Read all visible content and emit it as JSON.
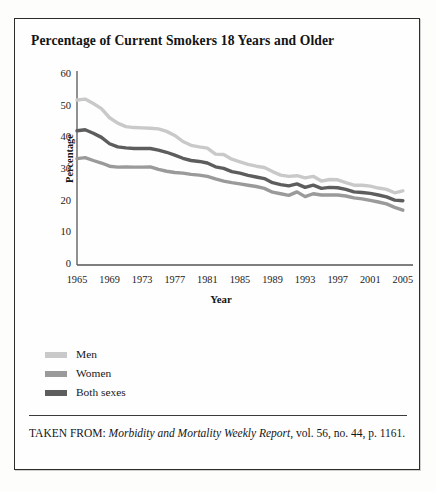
{
  "figure": {
    "title": "Percentage of Current Smokers 18 Years and Older",
    "source_prefix": "TAKEN FROM:",
    "source_italic": "Morbidity and Mortality Weekly Report",
    "source_rest": ", vol. 56, no. 44, p. 1161."
  },
  "legend": {
    "position": "below-plot",
    "items": [
      {
        "label": "Men",
        "color": "#c9c9c9"
      },
      {
        "label": "Women",
        "color": "#9a9a9a"
      },
      {
        "label": "Both sexes",
        "color": "#5d5d5d"
      }
    ]
  },
  "chart_data": {
    "type": "line",
    "title": "Percentage of Current Smokers 18 Years and Older",
    "xlabel": "Year",
    "ylabel": "Percentage",
    "xlim": [
      1965,
      2006
    ],
    "ylim": [
      0,
      60
    ],
    "yticks": [
      0,
      10,
      20,
      30,
      40,
      50,
      60
    ],
    "xticks": [
      1965,
      1969,
      1973,
      1977,
      1981,
      1985,
      1989,
      1993,
      1997,
      2001,
      2005
    ],
    "grid": false,
    "x": [
      1965,
      1966,
      1967,
      1968,
      1969,
      1970,
      1971,
      1972,
      1973,
      1974,
      1975,
      1976,
      1977,
      1978,
      1979,
      1980,
      1981,
      1982,
      1983,
      1984,
      1985,
      1986,
      1987,
      1988,
      1989,
      1990,
      1991,
      1992,
      1993,
      1994,
      1995,
      1996,
      1997,
      1998,
      1999,
      2000,
      2001,
      2002,
      2003,
      2004,
      2005
    ],
    "series": [
      {
        "name": "Men",
        "color": "#c9c9c9",
        "values": [
          52.1,
          52.4,
          51.0,
          49.4,
          46.5,
          44.8,
          43.7,
          43.4,
          43.3,
          43.2,
          43.0,
          42.2,
          40.9,
          39.0,
          37.8,
          37.3,
          36.9,
          35.0,
          34.9,
          33.4,
          32.6,
          31.8,
          31.2,
          30.8,
          29.5,
          28.4,
          28.0,
          28.2,
          27.5,
          28.0,
          26.5,
          27.0,
          26.9,
          26.0,
          25.2,
          25.2,
          24.9,
          24.3,
          23.9,
          22.8,
          23.4
        ]
      },
      {
        "name": "Women",
        "color": "#9a9a9a",
        "values": [
          33.6,
          33.9,
          33.0,
          32.2,
          31.2,
          30.9,
          31.0,
          30.9,
          30.9,
          31.0,
          30.2,
          29.6,
          29.2,
          29.0,
          28.6,
          28.4,
          28.0,
          27.2,
          26.5,
          26.0,
          25.6,
          25.2,
          24.8,
          24.2,
          23.0,
          22.5,
          22.0,
          23.1,
          21.6,
          22.5,
          22.1,
          22.1,
          22.1,
          21.8,
          21.2,
          20.9,
          20.4,
          19.9,
          19.3,
          18.2,
          17.3
        ]
      },
      {
        "name": "Both sexes",
        "color": "#5d5d5d",
        "values": [
          42.4,
          42.7,
          41.6,
          40.3,
          38.3,
          37.3,
          37.0,
          36.8,
          36.8,
          36.8,
          36.3,
          35.6,
          34.7,
          33.7,
          33.0,
          32.7,
          32.2,
          31.0,
          30.5,
          29.5,
          29.0,
          28.3,
          27.8,
          27.3,
          26.0,
          25.4,
          25.0,
          25.6,
          24.5,
          25.2,
          24.2,
          24.5,
          24.4,
          23.9,
          23.1,
          22.9,
          22.6,
          22.1,
          21.5,
          20.5,
          20.3
        ]
      }
    ]
  }
}
